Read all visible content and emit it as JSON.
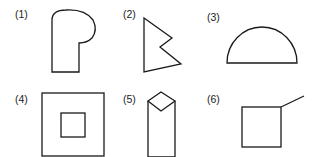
{
  "figures": [
    {
      "label": "(1)",
      "description": "rectangle with rounded bulge at top right (P-like shape)"
    },
    {
      "label": "(2)",
      "description": "triangle with notch (W-like polygon)"
    },
    {
      "label": "(3)",
      "description": "semicircle"
    },
    {
      "label": "(4)",
      "description": "square inside a square"
    },
    {
      "label": "(5)",
      "description": "rectangle topped with a diamond"
    },
    {
      "label": "(6)",
      "description": "square with a line extending from top-right corner"
    }
  ],
  "colors": {
    "stroke": "#1a1a1a",
    "background": "#ffffff",
    "text": "#222222"
  }
}
